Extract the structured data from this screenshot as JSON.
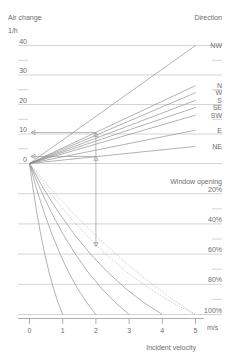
{
  "chart_data": {
    "type": "line",
    "title": "",
    "axis_titles": {
      "y_top": "Air change",
      "y_unit": "1/h",
      "x_title": "Incident velocity",
      "x_unit": "m/s",
      "right_top": "Direction",
      "right_mid": "Window opening"
    },
    "xlabel": "Incident velocity",
    "ylabel": "Air change",
    "xlim": [
      0,
      5
    ],
    "ylim": [
      0,
      40
    ],
    "grid": true,
    "legend_position": "right",
    "x_ticks": [
      {
        "label": "0",
        "value": 0
      },
      {
        "label": "1",
        "value": 1
      },
      {
        "label": "2",
        "value": 2
      },
      {
        "label": "3",
        "value": 3
      },
      {
        "label": "4",
        "value": 4
      },
      {
        "label": "5",
        "value": 5
      }
    ],
    "y_ticks": [
      {
        "label": "40",
        "value": 40
      },
      {
        "label": "",
        "value": 35
      },
      {
        "label": "30",
        "value": 30
      },
      {
        "label": "",
        "value": 25
      },
      {
        "label": "20",
        "value": 20
      },
      {
        "label": "",
        "value": 15
      },
      {
        "label": "10",
        "value": 10
      },
      {
        "label": "",
        "value": 5
      },
      {
        "label": "0",
        "value": 0
      }
    ],
    "right_ticks": [
      {
        "label": "20%",
        "value": 20
      },
      {
        "label": "",
        "value": 30
      },
      {
        "label": "40%",
        "value": 40
      },
      {
        "label": "",
        "value": 50
      },
      {
        "label": "60%",
        "value": 60
      },
      {
        "label": "",
        "value": 70
      },
      {
        "label": "80%",
        "value": 80
      },
      {
        "label": "",
        "value": 90
      },
      {
        "label": "100%",
        "value": 100
      }
    ],
    "direction_series": [
      {
        "name": "NW",
        "label": "NW",
        "end_y": 40.0
      },
      {
        "name": "N",
        "label": "N",
        "end_y": 26.4
      },
      {
        "name": "W",
        "label": "W",
        "end_y": 24.0
      },
      {
        "name": "S",
        "label": "S",
        "end_y": 21.4
      },
      {
        "name": "SE",
        "label": "SE",
        "end_y": 19.0
      },
      {
        "name": "SW",
        "label": "SW",
        "end_y": 16.4
      },
      {
        "name": "E",
        "label": "E",
        "end_y": 11.3
      },
      {
        "name": "NE",
        "label": "NE",
        "end_y": 5.8
      }
    ],
    "opening_series": [
      {
        "name": "20%",
        "label": "20%",
        "end_y": 20
      },
      {
        "name": "40%",
        "label": "40%",
        "end_y": 40
      },
      {
        "name": "60%",
        "label": "60%",
        "end_y": 60
      },
      {
        "name": "80%",
        "label": "80%",
        "end_y": 80
      },
      {
        "name": "100%",
        "label": "100%",
        "end_y": 100
      }
    ],
    "construction": {
      "velocity": 2.0,
      "air_change_upper": 10.5,
      "air_change_lower": 2.4,
      "window_opening": 55
    },
    "annotations": []
  }
}
